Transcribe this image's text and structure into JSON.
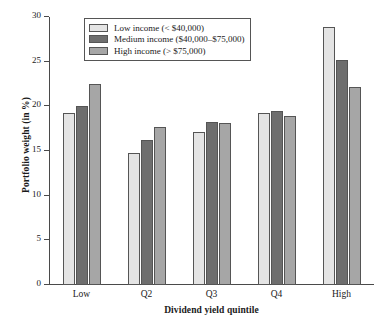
{
  "chart_data": {
    "type": "bar",
    "title": "",
    "xlabel": "Dividend yield quintile",
    "ylabel": "Portfolio weight (in %)",
    "categories": [
      "Low",
      "Q2",
      "Q3",
      "Q4",
      "High"
    ],
    "series": [
      {
        "name": "Low income (< $40,000)",
        "color": "#e4e4e4",
        "values": [
          19.2,
          14.8,
          17.1,
          19.2,
          28.9
        ]
      },
      {
        "name": "Medium income ($40,000–$75,000)",
        "color": "#6e6e6e",
        "values": [
          20.0,
          16.2,
          18.2,
          19.5,
          25.2
        ]
      },
      {
        "name": "High income (> $75,000)",
        "color": "#a6a6a6",
        "values": [
          22.5,
          17.7,
          18.1,
          18.9,
          22.2
        ]
      }
    ],
    "ylim": [
      0,
      30
    ],
    "yticks": [
      0,
      5,
      10,
      15,
      20,
      25,
      30
    ],
    "ytick_labels": [
      "0",
      "5",
      "10",
      "15",
      "20",
      "25",
      "30"
    ],
    "grid": false,
    "legend_position": "upper-left"
  }
}
